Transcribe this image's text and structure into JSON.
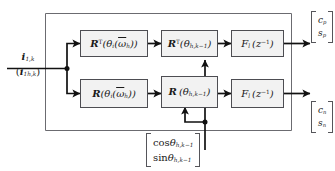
{
  "diagram": {
    "input": {
      "primary": "i₁,k",
      "secondary": "(i₁h,k)"
    },
    "top_row": [
      {
        "name": "rotation-transpose-theta-i",
        "label": "RT(θi(ω̄h))"
      },
      {
        "name": "rotation-transpose-theta-h",
        "label": "RT(θh,k−1)"
      },
      {
        "name": "filter-top",
        "label": "Fl(z−1)"
      }
    ],
    "bottom_row": [
      {
        "name": "rotation-theta-i",
        "label": "R(θi(ω̄h))"
      },
      {
        "name": "rotation-theta-h",
        "label": "R(θh,k−1)"
      },
      {
        "name": "filter-bottom",
        "label": "Fl(z−1)"
      }
    ],
    "outputs": {
      "top": {
        "row1": "cp",
        "row2": "sp"
      },
      "bottom": {
        "row1": "cn",
        "row2": "sn"
      }
    },
    "angle_input": {
      "row1": "cos θh,k−1",
      "row2": "sin θh,k−1"
    },
    "colors": {
      "frame": "#6b6b70",
      "block_border": "#4d4d52",
      "block_fill": "#f2f2f2",
      "signal": "#111111",
      "text": "#1a1a1a"
    }
  }
}
